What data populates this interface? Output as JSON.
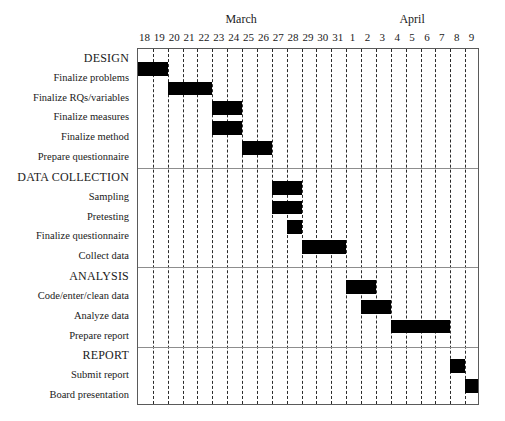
{
  "chart_data": {
    "type": "bar",
    "chart_kind": "gantt",
    "title": "",
    "xlabel": "",
    "ylabel": "",
    "grid": true,
    "legend": null,
    "months": [
      {
        "name": "March",
        "start_day_index": 0,
        "span": 14
      },
      {
        "name": "April",
        "start_day_index": 14,
        "span": 9
      }
    ],
    "day_ticks": [
      "18",
      "19",
      "20",
      "21",
      "22",
      "23",
      "24",
      "25",
      "26",
      "27",
      "28",
      "29",
      "30",
      "31",
      "1",
      "2",
      "3",
      "4",
      "5",
      "6",
      "7",
      "8",
      "9"
    ],
    "xlim": [
      0,
      23
    ],
    "colors": {
      "bar": "#000000",
      "grid": "#2b2b2b",
      "frame": "#5a5a5a",
      "rule": "#8d8d8d"
    },
    "sections": [
      {
        "name": "DESIGN",
        "tasks": [
          {
            "label": "Finalize problems",
            "start": 0,
            "end": 2,
            "start_date": "March 18",
            "end_date": "March 19"
          },
          {
            "label": "Finalize RQs/variables",
            "start": 2,
            "end": 5,
            "start_date": "March 20",
            "end_date": "March 22"
          },
          {
            "label": "Finalize measures",
            "start": 5,
            "end": 7,
            "start_date": "March 23",
            "end_date": "March 24"
          },
          {
            "label": "Finalize method",
            "start": 5,
            "end": 7,
            "start_date": "March 23",
            "end_date": "March 24"
          },
          {
            "label": "Prepare questionnaire",
            "start": 7,
            "end": 9,
            "start_date": "March 25",
            "end_date": "March 26"
          }
        ]
      },
      {
        "name": "DATA COLLECTION",
        "tasks": [
          {
            "label": "Sampling",
            "start": 9,
            "end": 11,
            "start_date": "March 27",
            "end_date": "March 28"
          },
          {
            "label": "Pretesting",
            "start": 9,
            "end": 11,
            "start_date": "March 27",
            "end_date": "March 28"
          },
          {
            "label": "Finalize questionnaire",
            "start": 10,
            "end": 11,
            "start_date": "March 28",
            "end_date": "March 28"
          },
          {
            "label": "Collect data",
            "start": 11,
            "end": 14,
            "start_date": "March 29",
            "end_date": "March 31"
          }
        ]
      },
      {
        "name": "ANALYSIS",
        "tasks": [
          {
            "label": "Code/enter/clean data",
            "start": 14,
            "end": 16,
            "start_date": "April 1",
            "end_date": "April 2"
          },
          {
            "label": "Analyze data",
            "start": 15,
            "end": 17,
            "start_date": "April 2",
            "end_date": "April 3"
          },
          {
            "label": "Prepare report",
            "start": 17,
            "end": 21,
            "start_date": "April 4",
            "end_date": "April 7"
          }
        ]
      },
      {
        "name": "REPORT",
        "tasks": [
          {
            "label": "Submit report",
            "start": 21,
            "end": 22,
            "start_date": "April 8",
            "end_date": "April 8"
          },
          {
            "label": "Board presentation",
            "start": 22,
            "end": 23,
            "start_date": "April 9",
            "end_date": "April 9"
          }
        ]
      }
    ]
  }
}
